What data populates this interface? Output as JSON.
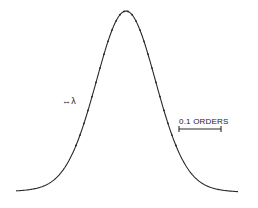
{
  "chart_data": {
    "type": "line",
    "title": "",
    "xlabel": "",
    "ylabel": "",
    "grid": false,
    "legend": null,
    "annotations": [
      {
        "text": "↔λ",
        "meaning": "wavelength direction indicator"
      },
      {
        "text": "0.1 ORDERS",
        "meaning": "horizontal scale bar"
      }
    ],
    "series": [
      {
        "name": "profile",
        "x": [
          -1.0,
          -0.9,
          -0.8,
          -0.7,
          -0.6,
          -0.5,
          -0.4,
          -0.35,
          -0.3,
          -0.25,
          -0.2,
          -0.15,
          -0.1,
          -0.05,
          0.0,
          0.05,
          0.1,
          0.15,
          0.2,
          0.25,
          0.3,
          0.35,
          0.4,
          0.5,
          0.6,
          0.7,
          0.8,
          0.9,
          1.0
        ],
        "values": [
          0.0,
          0.01,
          0.02,
          0.04,
          0.08,
          0.17,
          0.32,
          0.42,
          0.53,
          0.65,
          0.77,
          0.87,
          0.95,
          0.99,
          1.0,
          0.99,
          0.95,
          0.87,
          0.77,
          0.65,
          0.53,
          0.42,
          0.32,
          0.17,
          0.08,
          0.04,
          0.02,
          0.01,
          0.0
        ]
      }
    ],
    "scale_bar": {
      "label": "0.1 ORDERS",
      "x1_px": 179,
      "x2_px": 221,
      "y_px": 129
    }
  },
  "labels": {
    "lambda": "↔λ",
    "scale": "0.1 ORDERS"
  },
  "colors": {
    "line": "#2a2a2a",
    "background": "#ffffff"
  }
}
